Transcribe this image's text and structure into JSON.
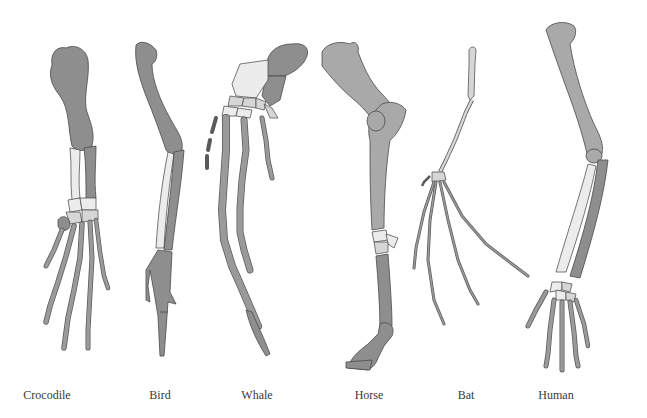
{
  "figure": {
    "colors": {
      "bone_dark": "#8e8e8e",
      "bone_light": "#ececec",
      "outline": "#4a4a4a",
      "label_text": "#3a3a3a",
      "background": "#ffffff"
    },
    "animals": [
      {
        "name": "Crocodile",
        "label_x": 47
      },
      {
        "name": "Bird",
        "label_x": 160
      },
      {
        "name": "Whale",
        "label_x": 257
      },
      {
        "name": "Horse",
        "label_x": 369
      },
      {
        "name": "Bat",
        "label_x": 466
      },
      {
        "name": "Human",
        "label_x": 556
      }
    ]
  }
}
